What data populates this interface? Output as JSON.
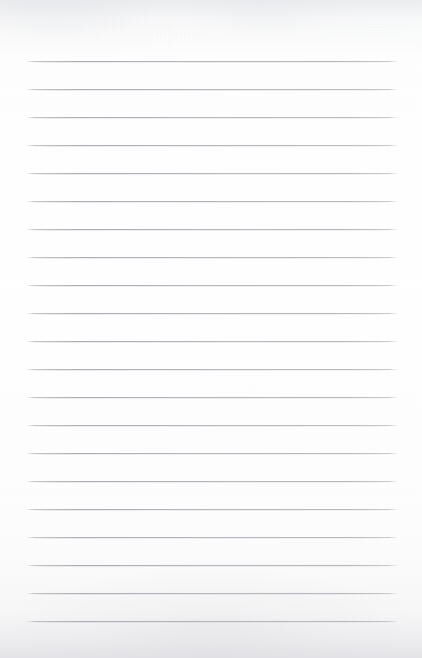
{
  "document": {
    "kind": "lined-notepad-page",
    "title": "Blank lined notepad page",
    "page_width": 422,
    "page_height": 658,
    "paper_color": "#fdfdfd",
    "content_text": "",
    "is_blank": true,
    "handwriting_present": false
  },
  "ruling": {
    "line_color": "#aeb0b5",
    "line_count": 21,
    "line_thickness_px": 1,
    "first_line_y": 61,
    "line_spacing_px": 28,
    "left_margin_x": 26,
    "right_margin_x": 398,
    "line_length_px": 372,
    "top_blank_margin_px": 61,
    "bottom_blank_margin_px": 36,
    "lines": [
      {
        "index": 1,
        "y": 61
      },
      {
        "index": 2,
        "y": 89
      },
      {
        "index": 3,
        "y": 117
      },
      {
        "index": 4,
        "y": 145
      },
      {
        "index": 5,
        "y": 173
      },
      {
        "index": 6,
        "y": 201
      },
      {
        "index": 7,
        "y": 229
      },
      {
        "index": 8,
        "y": 257
      },
      {
        "index": 9,
        "y": 285
      },
      {
        "index": 10,
        "y": 313
      },
      {
        "index": 11,
        "y": 341
      },
      {
        "index": 12,
        "y": 369
      },
      {
        "index": 13,
        "y": 397
      },
      {
        "index": 14,
        "y": 425
      },
      {
        "index": 15,
        "y": 453
      },
      {
        "index": 16,
        "y": 481
      },
      {
        "index": 17,
        "y": 509
      },
      {
        "index": 18,
        "y": 537
      },
      {
        "index": 19,
        "y": 565
      },
      {
        "index": 20,
        "y": 593
      },
      {
        "index": 21,
        "y": 621
      }
    ]
  },
  "scan_artifacts": {
    "top_shading": true,
    "bottom_shading": true,
    "grain": true
  }
}
